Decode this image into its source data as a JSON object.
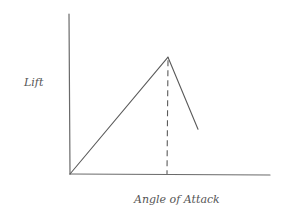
{
  "chart_data": {
    "type": "line",
    "style": "hand-drawn sketch",
    "title": "",
    "xlabel": "Angle of Attack",
    "ylabel": "Lift",
    "xticks": [],
    "yticks": [],
    "xlim": [
      0,
      1
    ],
    "ylim": [
      0,
      1
    ],
    "grid": false,
    "legend": null,
    "series": [
      {
        "name": "lift",
        "points": [
          {
            "x": 0.0,
            "y": 0.0
          },
          {
            "x": 0.49,
            "y": 0.73
          },
          {
            "x": 0.64,
            "y": 0.28
          }
        ]
      }
    ],
    "annotations": [
      {
        "type": "vertical-dashed-line",
        "label": "",
        "x": 0.49,
        "from_y": 0.0,
        "to_y": 0.73,
        "meaning": "stall angle / maximum lift"
      }
    ]
  },
  "colors": {
    "ink": "#5a5a5a",
    "background": "#ffffff"
  }
}
